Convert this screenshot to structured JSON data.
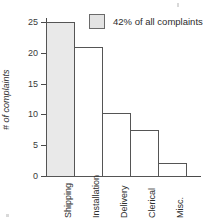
{
  "chart_data": {
    "type": "bar",
    "title": "",
    "xlabel": "",
    "ylabel": "# of complaints",
    "categories": [
      "Shipping",
      "Installation",
      "Delivery",
      "Clerical",
      "Misc."
    ],
    "values": [
      25,
      21,
      10.3,
      7.4,
      2.1
    ],
    "ylim": [
      0,
      26
    ],
    "yticks": [
      0,
      5,
      10,
      15,
      20,
      25
    ],
    "ytick_labels": [
      "0",
      "5",
      "10",
      "15",
      "20",
      "25"
    ],
    "grid": false,
    "legend": {
      "position": "top-right",
      "entries": [
        {
          "label": "42% of all complaints",
          "swatch_color": "#e3e3e3"
        }
      ]
    },
    "highlighted_category": "Shipping",
    "colors": {
      "bar_fill_default": "#ffffff",
      "bar_fill_highlight": "#e9e9e9",
      "bar_stroke": "#555555",
      "axis": "#4a4a4a",
      "text": "#2e2e2e"
    }
  }
}
